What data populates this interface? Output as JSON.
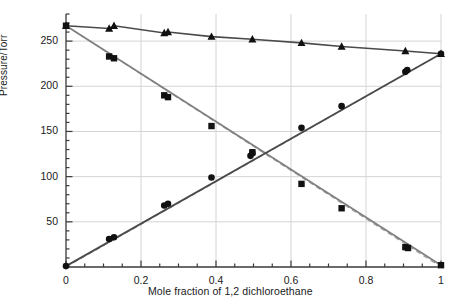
{
  "chart_data": {
    "type": "scatter",
    "title": "",
    "xlabel": "Mole fraction of 1,2 dichloroethane",
    "ylabel": "Pressure/Torr",
    "xlim": [
      0,
      1
    ],
    "ylim": [
      0,
      280
    ],
    "xticks": [
      0,
      0.2,
      0.4,
      0.6,
      0.8,
      1
    ],
    "xtick_labels": [
      "0",
      "0.2",
      "0.4",
      "0.6",
      "0.8",
      "1"
    ],
    "xminor_step": 0.05,
    "yticks": [
      50,
      100,
      150,
      200,
      250
    ],
    "ytick_labels": [
      "50",
      "100",
      "150",
      "200",
      "250"
    ],
    "yminor_step": 10,
    "grid": true,
    "grid_color": "#d4d4d4",
    "axis_color": "#3a3a3a",
    "legend": "none",
    "series": [
      {
        "name": "Total pressure",
        "marker": "triangle",
        "color": "#111111",
        "line_color": "#4a4a4a",
        "line_style": "solid",
        "points": [
          {
            "x": 0.0,
            "y": 267
          },
          {
            "x": 0.115,
            "y": 264
          },
          {
            "x": 0.128,
            "y": 267
          },
          {
            "x": 0.262,
            "y": 259
          },
          {
            "x": 0.272,
            "y": 260
          },
          {
            "x": 0.388,
            "y": 255
          },
          {
            "x": 0.497,
            "y": 252
          },
          {
            "x": 0.628,
            "y": 248
          },
          {
            "x": 0.735,
            "y": 244
          },
          {
            "x": 0.905,
            "y": 239
          },
          {
            "x": 1.0,
            "y": 236
          }
        ]
      },
      {
        "name": "Partial pressure of second component",
        "marker": "square",
        "color": "#111111",
        "line_color": "#808080",
        "line_style": "solid",
        "points": [
          {
            "x": 0.0,
            "y": 267
          },
          {
            "x": 0.115,
            "y": 233
          },
          {
            "x": 0.128,
            "y": 231
          },
          {
            "x": 0.262,
            "y": 190
          },
          {
            "x": 0.272,
            "y": 188
          },
          {
            "x": 0.388,
            "y": 156
          },
          {
            "x": 0.497,
            "y": 127
          },
          {
            "x": 0.628,
            "y": 92
          },
          {
            "x": 0.735,
            "y": 65
          },
          {
            "x": 0.905,
            "y": 22
          },
          {
            "x": 0.912,
            "y": 21
          },
          {
            "x": 1.0,
            "y": 2
          }
        ]
      },
      {
        "name": "Partial pressure of 1,2 dichloroethane",
        "marker": "circle",
        "color": "#111111",
        "line_color": "#4a4a4a",
        "line_style": "solid",
        "points": [
          {
            "x": 0.0,
            "y": 1
          },
          {
            "x": 0.115,
            "y": 31
          },
          {
            "x": 0.128,
            "y": 33
          },
          {
            "x": 0.262,
            "y": 68
          },
          {
            "x": 0.272,
            "y": 70
          },
          {
            "x": 0.388,
            "y": 99
          },
          {
            "x": 0.492,
            "y": 123
          },
          {
            "x": 0.497,
            "y": 126
          },
          {
            "x": 0.628,
            "y": 154
          },
          {
            "x": 0.735,
            "y": 178
          },
          {
            "x": 0.905,
            "y": 216
          },
          {
            "x": 0.91,
            "y": 218
          },
          {
            "x": 1.0,
            "y": 236
          }
        ]
      }
    ],
    "reference_lines": [
      {
        "name": "Raoult ideal line, component 2",
        "style": "dashed",
        "color": "#999999",
        "from": {
          "x": 0.0,
          "y": 267
        },
        "to": {
          "x": 1.0,
          "y": 0
        }
      },
      {
        "name": "Raoult ideal line, 1,2 dichloroethane",
        "style": "dashed",
        "color": "#999999",
        "from": {
          "x": 0.0,
          "y": 0
        },
        "to": {
          "x": 1.0,
          "y": 236
        }
      }
    ]
  },
  "axes": {
    "y_title": "Pressure/Torr",
    "x_title": "Mole fraction of 1,2 dichloroethane",
    "ytick_0": "250",
    "ytick_1": "200",
    "ytick_2": "150",
    "ytick_3": "100",
    "ytick_4": "50",
    "xtick_0": "0",
    "xtick_1": "0.2",
    "xtick_2": "0.4",
    "xtick_3": "0.6",
    "xtick_4": "0.8",
    "xtick_5": "1"
  }
}
